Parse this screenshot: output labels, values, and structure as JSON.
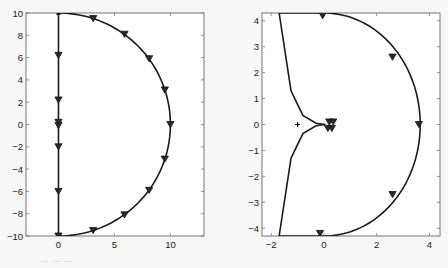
{
  "chart_data": [
    {
      "type": "line",
      "title": "",
      "xlabel": "",
      "ylabel": "",
      "grid": false,
      "legend": null,
      "xlim": [
        -2.9,
        13
      ],
      "ylim": [
        -10,
        10
      ],
      "xticks": [
        0,
        5,
        10
      ],
      "xtick_labels": [
        "0",
        "5",
        "10"
      ],
      "yticks": [
        -10,
        -8,
        -6,
        -4,
        -2,
        0,
        2,
        4,
        6,
        8,
        10
      ],
      "ytick_labels": [
        "−10",
        "−8",
        "−6",
        "−4",
        "−2",
        "0",
        "2",
        "4",
        "6",
        "8",
        "10"
      ],
      "box": {
        "left": 26,
        "top": 13,
        "right": 204,
        "bottom": 236
      },
      "series": [
        {
          "name": "imaginary-axis-segment",
          "style": "solid",
          "color": "#1a1a1a",
          "x": [
            0,
            0
          ],
          "y": [
            10,
            -10
          ]
        },
        {
          "name": "semicircle-arc",
          "style": "solid",
          "color": "#1a1a1a",
          "shape": "arc",
          "center": [
            0,
            0
          ],
          "radius": 10,
          "theta_start_deg": 90,
          "theta_end_deg": -90
        }
      ],
      "markers": {
        "symbol": "triangle-down",
        "points": [
          [
            0,
            6.2
          ],
          [
            0,
            2.2
          ],
          [
            0,
            0.2
          ],
          [
            0,
            -0.1
          ],
          [
            0,
            -2.0
          ],
          [
            0,
            -6.0
          ],
          [
            0,
            -10
          ],
          [
            3.1,
            9.5
          ],
          [
            5.9,
            8.1
          ],
          [
            8.1,
            5.9
          ],
          [
            9.5,
            3.1
          ],
          [
            10,
            0
          ],
          [
            9.5,
            -3.1
          ],
          [
            8.1,
            -5.9
          ],
          [
            5.9,
            -8.1
          ],
          [
            3.1,
            -9.5
          ]
        ],
        "small_square": [
          0,
          10
        ]
      }
    },
    {
      "type": "line",
      "title": "",
      "xlabel": "",
      "ylabel": "",
      "grid": false,
      "legend": null,
      "xlim": [
        -2.35,
        4.4
      ],
      "ylim": [
        -4.3,
        4.3
      ],
      "xticks": [
        -2,
        0,
        2,
        4
      ],
      "xtick_labels": [
        "−2",
        "0",
        "2",
        "4"
      ],
      "yticks": [
        -4,
        -3,
        -2,
        -1,
        0,
        1,
        2,
        3,
        4
      ],
      "ytick_labels": [
        "−4",
        "−3",
        "−2",
        "−1",
        "0",
        "1",
        "2",
        "3",
        "4"
      ],
      "box": {
        "left": 262,
        "top": 13,
        "right": 440,
        "bottom": 236
      },
      "series": [
        {
          "name": "upper-branch",
          "style": "solid",
          "color": "#1a1a1a",
          "x": [
            -1.7,
            -1.25,
            -0.8,
            -0.3,
            0.05
          ],
          "y": [
            4.3,
            1.3,
            0.35,
            0.05,
            0.0
          ]
        },
        {
          "name": "lower-branch",
          "style": "solid",
          "color": "#1a1a1a",
          "x": [
            -1.7,
            -1.25,
            -0.8,
            -0.3,
            0.05
          ],
          "y": [
            -4.3,
            -1.3,
            -0.35,
            -0.05,
            0.0
          ]
        },
        {
          "name": "top-edge",
          "style": "solid",
          "color": "#1a1a1a",
          "x": [
            -1.7,
            0
          ],
          "y": [
            4.3,
            4.3
          ]
        },
        {
          "name": "bottom-edge",
          "style": "solid",
          "color": "#1a1a1a",
          "x": [
            -1.7,
            0
          ],
          "y": [
            -4.3,
            -4.3
          ]
        },
        {
          "name": "semicircle-arc",
          "style": "solid",
          "color": "#1a1a1a",
          "shape": "arc",
          "center": [
            0,
            0
          ],
          "radius_x": 3.65,
          "radius_y": 4.3,
          "theta_start_deg": 90,
          "theta_end_deg": -90
        }
      ],
      "markers": {
        "symbol": "triangle-down",
        "points": [
          [
            -0.05,
            4.2
          ],
          [
            2.6,
            2.6
          ],
          [
            3.6,
            0.0
          ],
          [
            2.6,
            -2.7
          ],
          [
            -0.15,
            -4.2
          ],
          [
            0.2,
            0.1
          ],
          [
            0.35,
            0.1
          ],
          [
            0.3,
            -0.15
          ],
          [
            0.15,
            -0.15
          ]
        ],
        "plus_marker": [
          -1.0,
          0.0
        ]
      }
    }
  ],
  "caption": "…                                  …                                                  …"
}
